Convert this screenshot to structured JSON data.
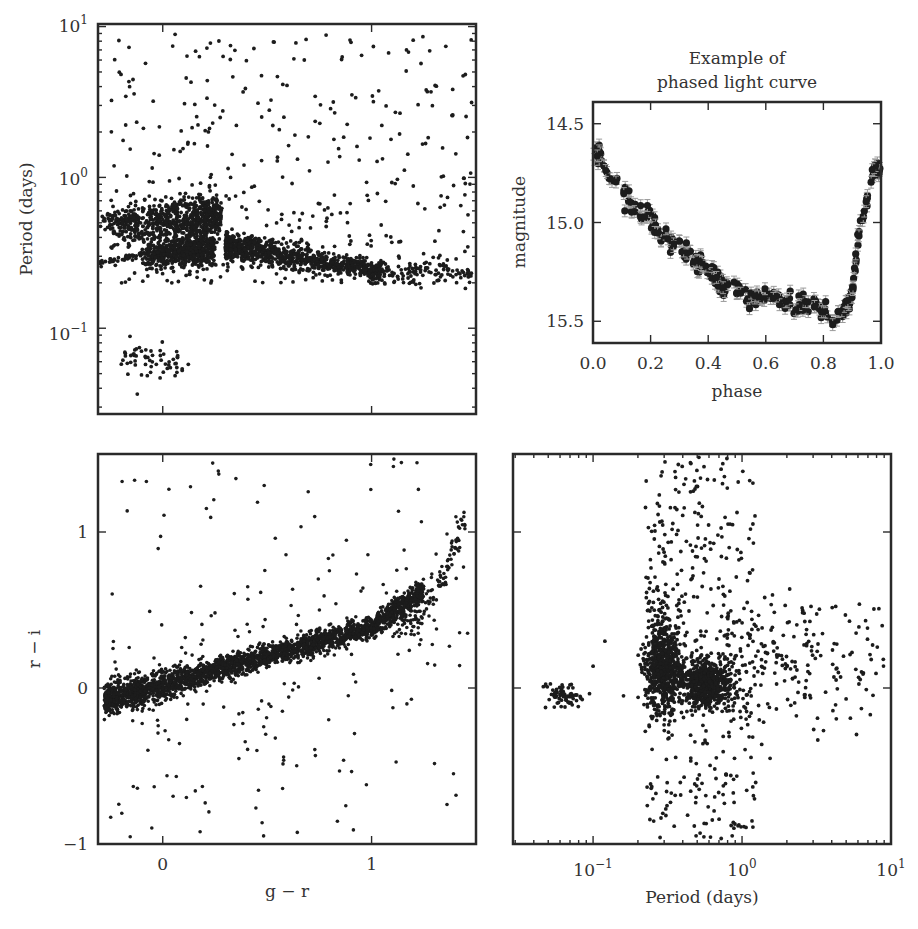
{
  "figure": {
    "width": 918,
    "height": 929,
    "point_color": "#1c1c1c",
    "frame_color": "#2a2a2a",
    "errorbar_color": "#9a9a9a"
  },
  "chart_data": [
    {
      "id": "period_vs_gr",
      "type": "scatter",
      "title": "",
      "xlabel": "",
      "ylabel": "Period (days)",
      "xscale": "linear",
      "yscale": "log",
      "xlim": [
        -0.31,
        1.5
      ],
      "ylim": [
        0.027,
        10.4
      ],
      "xticks": [
        0,
        1
      ],
      "xtick_labels": [],
      "yticks": [
        0.1,
        1,
        10
      ],
      "ytick_labels": [
        "10−1",
        "10⁰",
        "10¹"
      ],
      "frame_px": [
        98,
        24,
        476,
        414
      ],
      "clusters": [
        {
          "name": "RR Lyrae ab (upper clump)",
          "n": 700,
          "x": [
            -0.25,
            0.28
          ],
          "logy_center": -0.28,
          "logy_sd": 0.07,
          "x_skew": 0.12
        },
        {
          "name": "RR Lyrae c (lower clump)",
          "n": 600,
          "x": [
            -0.1,
            0.25
          ],
          "logy_center": -0.5,
          "logy_sd": 0.05,
          "x_skew": 0.25
        },
        {
          "name": "Contact binaries sequence",
          "n": 900,
          "x": [
            0.3,
            1.05
          ],
          "logy_start": -0.45,
          "logy_end": -0.63,
          "logy_sd": 0.05
        },
        {
          "name": "Short-period clump",
          "n": 60,
          "x": [
            -0.22,
            0.13
          ],
          "logy_center": -1.2,
          "logy_sd": 0.07
        },
        {
          "name": "Scattered long-period",
          "n": 380,
          "x": [
            -0.25,
            1.48
          ],
          "logy_range": [
            -0.7,
            0.95
          ]
        }
      ]
    },
    {
      "id": "phased_light_curve",
      "type": "scatter",
      "title": "Example of\nphased light curve",
      "title_lines": [
        "Example of",
        "phased light curve"
      ],
      "xlabel": "phase",
      "ylabel": "magnitude",
      "xlim": [
        0.0,
        1.0
      ],
      "ylim": [
        15.61,
        14.39
      ],
      "y_inverted": true,
      "xticks": [
        0.0,
        0.2,
        0.4,
        0.6,
        0.8,
        1.0
      ],
      "xtick_labels": [
        "0.0",
        "0.2",
        "0.4",
        "0.6",
        "0.8",
        "1.0"
      ],
      "yticks": [
        14.5,
        15.0,
        15.5
      ],
      "ytick_labels": [
        "14.5",
        "15.0",
        "15.5"
      ],
      "frame_px": [
        593,
        102,
        881,
        343
      ],
      "curve": {
        "phase": [
          0.0,
          0.02,
          0.05,
          0.1,
          0.15,
          0.2,
          0.25,
          0.3,
          0.35,
          0.4,
          0.45,
          0.5,
          0.55,
          0.6,
          0.65,
          0.7,
          0.75,
          0.8,
          0.83,
          0.86,
          0.88,
          0.9,
          0.92,
          0.94,
          0.96,
          0.98,
          1.0
        ],
        "magnitude": [
          14.66,
          14.65,
          14.74,
          14.84,
          14.93,
          15.0,
          15.07,
          15.12,
          15.18,
          15.25,
          15.31,
          15.34,
          15.37,
          15.37,
          15.39,
          15.42,
          15.41,
          15.44,
          15.49,
          15.47,
          15.43,
          15.35,
          15.1,
          14.95,
          14.82,
          14.7,
          14.75
        ],
        "n_points": 260,
        "scatter_sd": 0.025,
        "errorbar": 0.03
      }
    },
    {
      "id": "ri_vs_gr",
      "type": "scatter",
      "title": "",
      "xlabel": "g − r",
      "ylabel": "r − i",
      "xlim": [
        -0.31,
        1.5
      ],
      "ylim": [
        -1.0,
        1.5
      ],
      "xticks": [
        0,
        1
      ],
      "xtick_labels": [
        "0",
        "1"
      ],
      "yticks": [
        -1,
        0,
        1
      ],
      "ytick_labels": [
        "−1",
        "0",
        "1"
      ],
      "frame_px": [
        98,
        454,
        476,
        844
      ],
      "clusters": [
        {
          "name": "Stellar locus",
          "n": 2600,
          "x": [
            -0.28,
            1.25
          ],
          "relation": "ri = 0.37*gr + 0.02 (+ curving up above gr 1.0)",
          "sd": 0.035
        },
        {
          "name": "Red tail",
          "n": 140,
          "x": [
            1.1,
            1.45
          ],
          "ri_range": [
            0.4,
            1.15
          ]
        },
        {
          "name": "Outliers",
          "n": 230,
          "x": [
            -0.28,
            1.48
          ],
          "ri_range": [
            -0.98,
            1.48
          ]
        }
      ]
    },
    {
      "id": "ri_vs_period",
      "type": "scatter",
      "title": "",
      "xlabel": "Period (days)",
      "ylabel": "",
      "xscale": "log",
      "yscale": "linear",
      "xlim": [
        0.029,
        10.0
      ],
      "ylim": [
        -1.0,
        1.5
      ],
      "xticks": [
        0.1,
        1,
        10
      ],
      "xtick_labels": [
        "10−1",
        "10⁰",
        "10¹"
      ],
      "yticks": [
        -1,
        0,
        1
      ],
      "ytick_labels": [],
      "frame_px": [
        513,
        454,
        891,
        844
      ],
      "clusters": [
        {
          "name": "Short-period clump",
          "n": 70,
          "logx_center": -1.2,
          "logx_sd": 0.07,
          "ri_center": -0.05,
          "ri_sd": 0.05
        },
        {
          "name": "RR Lyrae c",
          "n": 700,
          "logx_center": -0.53,
          "logx_sd": 0.06,
          "ri_center": 0.1,
          "ri_sd": 0.12
        },
        {
          "name": "RR Lyrae ab",
          "n": 700,
          "logx_center": -0.25,
          "logx_sd": 0.07,
          "ri_center": 0.03,
          "ri_sd": 0.07
        },
        {
          "name": "Scattered",
          "n": 600,
          "logx_range": [
            -0.7,
            0.95
          ],
          "ri_range": [
            -0.98,
            1.48
          ]
        }
      ]
    }
  ]
}
